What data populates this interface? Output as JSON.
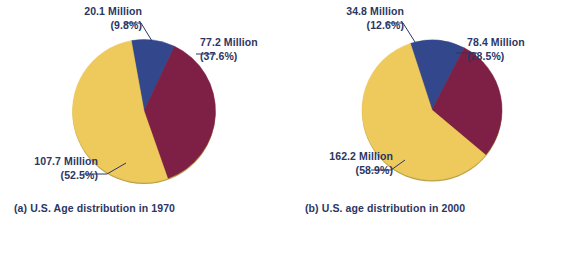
{
  "figure": {
    "background": "#ffffff",
    "text_color": "#2b3663",
    "colors": {
      "blue": "#33488c",
      "red": "#7e1f45",
      "yellow": "#eec95c",
      "edge": "#b9a24c"
    }
  },
  "chart_data": [
    {
      "type": "pie",
      "id": "a",
      "title": "(a) U.S. Age distribution in 1970",
      "caption": "(a) U.S. Age distribution in 1970",
      "unit": "Million",
      "total": 205.0,
      "legend": "none",
      "start_angle_deg": -10,
      "direction": "clockwise",
      "categories": [
        "20.1 Million",
        "77.2 Million",
        "107.7 Million"
      ],
      "values": [
        20.1,
        77.2,
        107.7
      ],
      "percentages": [
        9.8,
        37.6,
        52.5
      ],
      "slices": [
        {
          "name": "blue-slice",
          "value": "20.1 Million",
          "percent": "(9.8%)",
          "value_number": 20.1,
          "percent_number": 9.8,
          "color": "#33488c"
        },
        {
          "name": "red-slice",
          "value": "77.2 Million",
          "percent": "(37.6%)",
          "value_number": 77.2,
          "percent_number": 37.6,
          "color": "#7e1f45"
        },
        {
          "name": "yellow-slice",
          "value": "107.7 Million",
          "percent": "(52.5%)",
          "value_number": 107.7,
          "percent_number": 52.5,
          "color": "#eec95c"
        }
      ]
    },
    {
      "type": "pie",
      "id": "b",
      "title": "(b) U.S. age distribution in 2000",
      "caption": "(b) U.S. age distribution in 2000",
      "unit": "Million",
      "total": 275.4,
      "legend": "none",
      "start_angle_deg": -18,
      "direction": "clockwise",
      "categories": [
        "34.8 Million",
        "78.4 Million",
        "162.2 Million"
      ],
      "values": [
        34.8,
        78.4,
        162.2
      ],
      "percentages": [
        12.6,
        28.5,
        58.9
      ],
      "slices": [
        {
          "name": "blue-slice",
          "value": "34.8 Million",
          "percent": "(12.6%)",
          "value_number": 34.8,
          "percent_number": 12.6,
          "color": "#33488c"
        },
        {
          "name": "red-slice",
          "value": "78.4 Million",
          "percent": "(28.5%)",
          "value_number": 78.4,
          "percent_number": 28.5,
          "color": "#7e1f45"
        },
        {
          "name": "yellow-slice",
          "value": "162.2 Million",
          "percent": "(58.9%)",
          "value_number": 162.2,
          "percent_number": 58.9,
          "color": "#eec95c"
        }
      ]
    }
  ]
}
